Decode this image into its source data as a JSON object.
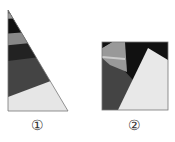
{
  "figures": [
    {
      "id": "1",
      "label": "①",
      "shape": "right-triangle",
      "band_colors": [
        "#555555",
        "#999999",
        "#111111",
        "#888888",
        "#222222",
        "#444444",
        "#e6e6e6"
      ]
    },
    {
      "id": "2",
      "label": "②",
      "shape": "square",
      "region_colors": [
        "#111111",
        "#999999",
        "#444444",
        "#e8e8e8"
      ]
    }
  ],
  "colors": {
    "outline": "#777777",
    "background": "#ffffff"
  }
}
